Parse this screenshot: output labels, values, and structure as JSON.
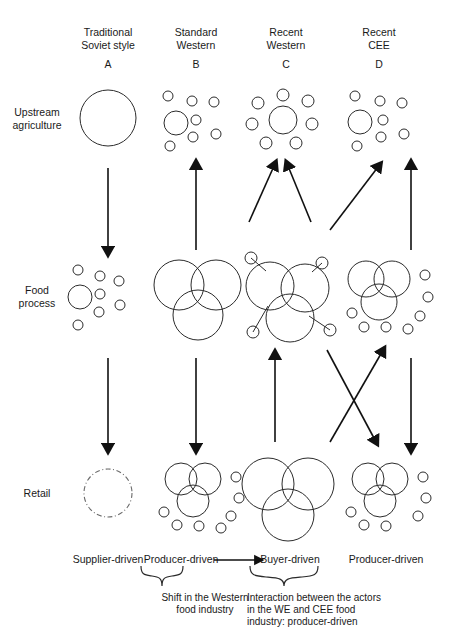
{
  "figure": {
    "title": "",
    "columns": [
      {
        "id": "A",
        "heading": "Traditional\nSoviet style",
        "letter": "A",
        "cx": 108,
        "bottom_label": "Supplier-driven"
      },
      {
        "id": "B",
        "heading": "Standard\nWestern",
        "letter": "B",
        "cx": 196,
        "bottom_label": "Producer-driven"
      },
      {
        "id": "C",
        "heading": "Recent\nWestern",
        "letter": "C",
        "cx": 286,
        "bottom_label": "Buyer-driven"
      },
      {
        "id": "D",
        "heading": "Recent\nCEE",
        "letter": "D",
        "cx": 379,
        "bottom_label": "Producer-driven"
      }
    ],
    "rows": [
      {
        "id": "upstream",
        "label": "Upstream\nagriculture",
        "cy": 118
      },
      {
        "id": "food",
        "label": "Food\nprocess",
        "cy": 296
      },
      {
        "id": "retail",
        "label": "Retail",
        "cy": 492
      }
    ],
    "captions": [
      {
        "id": "shift",
        "text": "Shift in the Western\nfood industry",
        "align": "center"
      },
      {
        "id": "interaction",
        "text": "Interaction between the actors\nin the WE and CEE food\nindustry: producer-driven",
        "align": "left"
      }
    ],
    "colors": {
      "stroke": "#2b2b2b",
      "arrow": "#111111",
      "text": "#1a1a1a"
    }
  },
  "chart_data": {
    "type": "diagram",
    "clusters": {
      "upstream": {
        "A": {
          "style": "single-large-circle",
          "big": [
            {
              "cx": 108,
              "cy": 118,
              "r": 28
            }
          ],
          "small": []
        },
        "B": {
          "style": "one-medium-with-scatter",
          "big": [
            {
              "cx": 176,
              "cy": 123,
              "r": 12
            }
          ],
          "small": [
            {
              "cx": 168,
              "cy": 96,
              "r": 5
            },
            {
              "cx": 192,
              "cy": 101,
              "r": 5
            },
            {
              "cx": 214,
              "cy": 102,
              "r": 5
            },
            {
              "cx": 196,
              "cy": 120,
              "r": 5
            },
            {
              "cx": 193,
              "cy": 137,
              "r": 5
            },
            {
              "cx": 216,
              "cy": 134,
              "r": 5
            },
            {
              "cx": 170,
              "cy": 146,
              "r": 5
            }
          ]
        },
        "C": {
          "style": "medium-ringed-by-small",
          "big": [
            {
              "cx": 283,
              "cy": 120,
              "r": 14
            }
          ],
          "small": [
            {
              "cx": 283,
              "cy": 95,
              "r": 6
            },
            {
              "cx": 258,
              "cy": 103,
              "r": 6
            },
            {
              "cx": 308,
              "cy": 101,
              "r": 6
            },
            {
              "cx": 252,
              "cy": 124,
              "r": 6
            },
            {
              "cx": 312,
              "cy": 124,
              "r": 6
            },
            {
              "cx": 266,
              "cy": 143,
              "r": 6
            },
            {
              "cx": 296,
              "cy": 143,
              "r": 6
            }
          ]
        },
        "D": {
          "style": "one-medium-with-scatter",
          "big": [
            {
              "cx": 360,
              "cy": 122,
              "r": 12
            }
          ],
          "small": [
            {
              "cx": 355,
              "cy": 96,
              "r": 5
            },
            {
              "cx": 380,
              "cy": 101,
              "r": 5
            },
            {
              "cx": 402,
              "cy": 103,
              "r": 5
            },
            {
              "cx": 383,
              "cy": 120,
              "r": 5
            },
            {
              "cx": 381,
              "cy": 137,
              "r": 5
            },
            {
              "cx": 404,
              "cy": 134,
              "r": 5
            },
            {
              "cx": 357,
              "cy": 146,
              "r": 5
            }
          ]
        }
      },
      "food": {
        "A": {
          "style": "one-medium-with-scatter",
          "big": [
            {
              "cx": 80,
              "cy": 297,
              "r": 12
            }
          ],
          "small": [
            {
              "cx": 78,
              "cy": 270,
              "r": 5
            },
            {
              "cx": 100,
              "cy": 276,
              "r": 5
            },
            {
              "cx": 119,
              "cy": 281,
              "r": 5
            },
            {
              "cx": 100,
              "cy": 294,
              "r": 5
            },
            {
              "cx": 99,
              "cy": 312,
              "r": 5
            },
            {
              "cx": 120,
              "cy": 305,
              "r": 5
            },
            {
              "cx": 78,
              "cy": 325,
              "r": 5
            }
          ]
        },
        "B": {
          "style": "three-overlapping",
          "big": [
            {
              "cx": 179,
              "cy": 285,
              "r": 25
            },
            {
              "cx": 216,
              "cy": 285,
              "r": 25
            },
            {
              "cx": 198,
              "cy": 315,
              "r": 25
            }
          ],
          "small": []
        },
        "C": {
          "style": "three-overlapping-with-satellites",
          "big": [
            {
              "cx": 270,
              "cy": 286,
              "r": 24
            },
            {
              "cx": 305,
              "cy": 288,
              "r": 24
            },
            {
              "cx": 290,
              "cy": 318,
              "r": 24
            }
          ],
          "small": [
            {
              "cx": 251,
              "cy": 258,
              "r": 6
            },
            {
              "cx": 322,
              "cy": 263,
              "r": 6
            },
            {
              "cx": 253,
              "cy": 332,
              "r": 6
            },
            {
              "cx": 330,
              "cy": 330,
              "r": 6
            }
          ],
          "links": [
            [
              251,
              258,
              266,
              271
            ],
            [
              322,
              263,
              312,
              272
            ],
            [
              253,
              332,
              268,
              306
            ],
            [
              330,
              330,
              309,
              316
            ]
          ]
        },
        "D": {
          "style": "three-overlapping-with-scatter",
          "big": [
            {
              "cx": 366,
              "cy": 279,
              "r": 18
            },
            {
              "cx": 392,
              "cy": 279,
              "r": 18
            },
            {
              "cx": 379,
              "cy": 302,
              "r": 18
            }
          ],
          "small": [
            {
              "cx": 425,
              "cy": 275,
              "r": 5
            },
            {
              "cx": 428,
              "cy": 297,
              "r": 5
            },
            {
              "cx": 352,
              "cy": 313,
              "r": 5
            },
            {
              "cx": 420,
              "cy": 316,
              "r": 5
            },
            {
              "cx": 364,
              "cy": 327,
              "r": 5
            },
            {
              "cx": 386,
              "cy": 327,
              "r": 5
            },
            {
              "cx": 408,
              "cy": 329,
              "r": 5
            }
          ]
        }
      },
      "retail": {
        "A": {
          "style": "dashed-circle",
          "big": [
            {
              "cx": 108,
              "cy": 493,
              "r": 24,
              "dashed": true
            }
          ],
          "small": []
        },
        "B": {
          "style": "three-overlapping-with-scatter",
          "big": [
            {
              "cx": 181,
              "cy": 479,
              "r": 16
            },
            {
              "cx": 205,
              "cy": 479,
              "r": 16
            },
            {
              "cx": 193,
              "cy": 501,
              "r": 16
            }
          ],
          "small": [
            {
              "cx": 236,
              "cy": 477,
              "r": 5
            },
            {
              "cx": 239,
              "cy": 498,
              "r": 5
            },
            {
              "cx": 164,
              "cy": 512,
              "r": 5
            },
            {
              "cx": 231,
              "cy": 516,
              "r": 5
            },
            {
              "cx": 177,
              "cy": 525,
              "r": 5
            },
            {
              "cx": 199,
              "cy": 526,
              "r": 5
            },
            {
              "cx": 221,
              "cy": 528,
              "r": 5
            }
          ]
        },
        "C": {
          "style": "three-large-overlapping",
          "big": [
            {
              "cx": 268,
              "cy": 484,
              "r": 26
            },
            {
              "cx": 308,
              "cy": 484,
              "r": 26
            },
            {
              "cx": 288,
              "cy": 515,
              "r": 26
            }
          ],
          "small": []
        },
        "D": {
          "style": "three-overlapping-with-scatter",
          "big": [
            {
              "cx": 368,
              "cy": 479,
              "r": 16
            },
            {
              "cx": 392,
              "cy": 479,
              "r": 16
            },
            {
              "cx": 380,
              "cy": 501,
              "r": 16
            }
          ],
          "small": [
            {
              "cx": 423,
              "cy": 477,
              "r": 5
            },
            {
              "cx": 426,
              "cy": 498,
              "r": 5
            },
            {
              "cx": 351,
              "cy": 512,
              "r": 5
            },
            {
              "cx": 418,
              "cy": 516,
              "r": 5
            },
            {
              "cx": 364,
              "cy": 525,
              "r": 5
            },
            {
              "cx": 386,
              "cy": 526,
              "r": 5
            }
          ]
        }
      }
    },
    "arrows": [
      {
        "id": "A-upstream-to-food",
        "from": [
          108,
          168
        ],
        "to": [
          108,
          250
        ],
        "direction": "down"
      },
      {
        "id": "B-food-to-upstream",
        "from": [
          196,
          250
        ],
        "to": [
          196,
          166
        ],
        "direction": "up"
      },
      {
        "id": "C-food-to-upstream-left",
        "from": [
          249,
          222
        ],
        "to": [
          274,
          166
        ],
        "direction": "up"
      },
      {
        "id": "C-food-to-upstream-right",
        "from": [
          311,
          222
        ],
        "to": [
          288,
          166
        ],
        "direction": "up"
      },
      {
        "id": "CD-food-to-upstream-diagonal",
        "from": [
          330,
          230
        ],
        "to": [
          378,
          167
        ],
        "direction": "up"
      },
      {
        "id": "D-food-to-upstream",
        "from": [
          411,
          250
        ],
        "to": [
          411,
          166
        ],
        "direction": "up"
      },
      {
        "id": "A-food-to-retail",
        "from": [
          108,
          358
        ],
        "to": [
          108,
          447
        ],
        "direction": "down"
      },
      {
        "id": "B-food-to-retail",
        "from": [
          196,
          358
        ],
        "to": [
          196,
          447
        ],
        "direction": "down"
      },
      {
        "id": "C-retail-to-food",
        "from": [
          275,
          442
        ],
        "to": [
          275,
          356
        ],
        "direction": "up"
      },
      {
        "id": "CD-cross-down",
        "from": [
          327,
          350
        ],
        "to": [
          375,
          440
        ],
        "direction": "down"
      },
      {
        "id": "DC-cross-up",
        "from": [
          330,
          442
        ],
        "to": [
          382,
          352
        ],
        "direction": "up"
      },
      {
        "id": "D-food-to-retail",
        "from": [
          411,
          358
        ],
        "to": [
          411,
          447
        ],
        "direction": "down"
      },
      {
        "id": "producer-to-buyer",
        "from": [
          214,
          560
        ],
        "to": [
          258,
          560
        ],
        "direction": "right"
      }
    ]
  }
}
